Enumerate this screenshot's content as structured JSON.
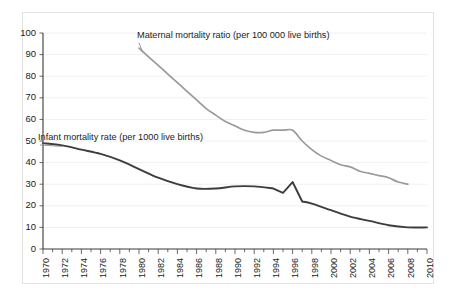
{
  "chart_data": {
    "type": "line",
    "title": "",
    "xlabel": "",
    "ylabel": "",
    "xlim": [
      1970,
      2010
    ],
    "ylim": [
      0,
      100
    ],
    "grid": true,
    "legend_position": "inline-annotations",
    "y_ticks": [
      0,
      10,
      20,
      30,
      40,
      50,
      60,
      70,
      80,
      90,
      100
    ],
    "x_ticks": [
      1970,
      1972,
      1974,
      1976,
      1978,
      1980,
      1982,
      1984,
      1986,
      1988,
      1990,
      1992,
      1994,
      1996,
      1998,
      2000,
      2002,
      2004,
      2006,
      2008,
      2010
    ],
    "x_minor_ticks_every": 1,
    "series": [
      {
        "name": "Maternal mortality ratio (per 100 000 live births)",
        "color": "#9a9a9a",
        "x": [
          1980,
          1981,
          1982,
          1983,
          1984,
          1985,
          1986,
          1987,
          1988,
          1989,
          1990,
          1991,
          1992,
          1993,
          1994,
          1995,
          1996,
          1997,
          1998,
          1999,
          2000,
          2001,
          2002,
          2003,
          2004,
          2005,
          2006,
          2007,
          2008
        ],
        "values": [
          93,
          89,
          85,
          81,
          77,
          73,
          69,
          65,
          62,
          59,
          57,
          55,
          54,
          54,
          55,
          55,
          55,
          50,
          46,
          43,
          41,
          39,
          38,
          36,
          35,
          34,
          33,
          31,
          30
        ]
      },
      {
        "name": "Infant mortality rate (per 1000 live births)",
        "color": "#3d3d3d",
        "x": [
          1970,
          1972,
          1974,
          1976,
          1978,
          1980,
          1982,
          1984,
          1986,
          1988,
          1990,
          1992,
          1994,
          1995,
          1996,
          1997,
          1998,
          2000,
          2002,
          2004,
          2006,
          2008,
          2010
        ],
        "values": [
          49,
          48,
          46,
          44,
          41,
          37,
          33,
          30,
          28,
          28,
          29,
          29,
          28,
          26,
          31,
          22,
          21,
          18,
          15,
          13,
          11,
          10,
          10
        ]
      }
    ],
    "annotations": [
      {
        "id": "maternal-label",
        "text": "Maternal mortality ratio (per 100 000 live births)",
        "x_px": 137,
        "y_px": 38
      },
      {
        "id": "infant-label",
        "text": "Infant mortality rate (per 1000 live births)",
        "x_px": 38,
        "y_px": 140
      }
    ]
  },
  "axis": {
    "y_tick_labels": [
      "100",
      "90",
      "80",
      "70",
      "60",
      "50",
      "40",
      "30",
      "20",
      "10",
      "0"
    ],
    "x_tick_labels": [
      "1970",
      "1972",
      "1974",
      "1976",
      "1978",
      "1980",
      "1982",
      "1984",
      "1986",
      "1988",
      "1990",
      "1992",
      "1994",
      "1996",
      "1998",
      "2000",
      "2002",
      "2004",
      "2006",
      "2008",
      "2010"
    ]
  },
  "colors": {
    "infant_line": "#3d3d3d",
    "maternal_line": "#9a9a9a",
    "grid": "#f0f0f0",
    "axis": "#3a3a3a",
    "frame_border": "#e3e3e3",
    "background": "#ffffff"
  }
}
